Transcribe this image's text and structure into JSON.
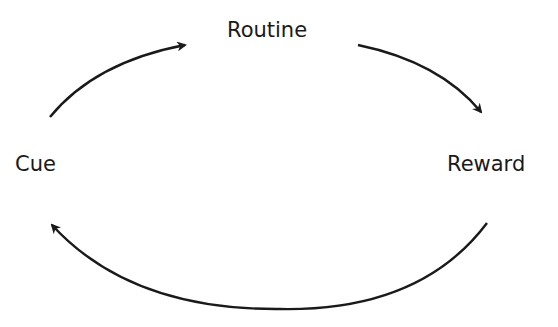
{
  "diagram": {
    "type": "cycle",
    "nodes": [
      {
        "id": "routine",
        "label": "Routine"
      },
      {
        "id": "reward",
        "label": "Reward"
      },
      {
        "id": "cue",
        "label": "Cue"
      }
    ],
    "edges": [
      {
        "from": "cue",
        "to": "routine"
      },
      {
        "from": "routine",
        "to": "reward"
      },
      {
        "from": "reward",
        "to": "cue"
      }
    ],
    "colors": {
      "stroke": "#1a1a1a",
      "background": "#ffffff"
    }
  }
}
